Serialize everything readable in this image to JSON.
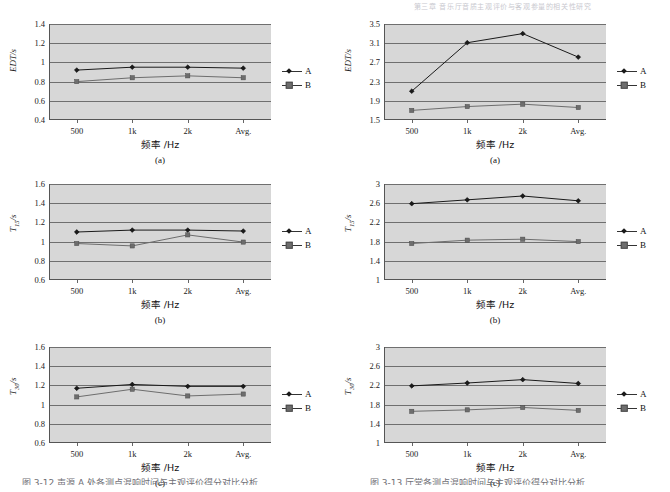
{
  "header": {
    "text": "第三章 音乐厅音质主观评价与客观参量的相关性研究"
  },
  "legend": {
    "series_a": "A",
    "series_b": "B"
  },
  "axis": {
    "x_title": "频率 /Hz",
    "x_categories": [
      "500",
      "1k",
      "2k",
      "Avg."
    ]
  },
  "captions": {
    "a": "(a)",
    "b": "(b)",
    "c": "(c)"
  },
  "bottom_captions": {
    "left": "图 3-12  声源 A 处各测点混响时间与主观评价得分对比分析",
    "right": "图 3-13  厅堂各测点混响时间与主观评价得分对比分析"
  },
  "chart_data": [
    {
      "id": "left-a",
      "type": "line",
      "title": "",
      "ylabel": "EDT/s",
      "xlabel": "频率 /Hz",
      "categories": [
        "500",
        "1k",
        "2k",
        "Avg."
      ],
      "yticks": [
        0.4,
        0.6,
        0.8,
        1.0,
        1.2,
        1.4
      ],
      "yticklabels": [
        "0.4",
        "0.6",
        "0.8",
        "1",
        "1.2",
        "1.4"
      ],
      "ylim": [
        0.4,
        1.4
      ],
      "grid": true,
      "legend_position": "right",
      "series": [
        {
          "name": "A",
          "values": [
            0.92,
            0.95,
            0.95,
            0.94
          ]
        },
        {
          "name": "B",
          "values": [
            0.8,
            0.84,
            0.86,
            0.84
          ]
        }
      ],
      "caption": "(a)"
    },
    {
      "id": "right-a",
      "type": "line",
      "title": "",
      "ylabel": "EDT/s",
      "xlabel": "频率 /Hz",
      "categories": [
        "500",
        "1k",
        "2k",
        "Avg."
      ],
      "yticks": [
        1.5,
        1.9,
        2.3,
        2.7,
        3.1,
        3.5
      ],
      "yticklabels": [
        "1.5",
        "1.9",
        "2.3",
        "2.7",
        "3.1",
        "3.5"
      ],
      "ylim": [
        1.5,
        3.5
      ],
      "grid": true,
      "legend_position": "right",
      "series": [
        {
          "name": "A",
          "values": [
            2.1,
            3.11,
            3.3,
            2.81
          ]
        },
        {
          "name": "B",
          "values": [
            1.7,
            1.78,
            1.83,
            1.76
          ]
        }
      ],
      "caption": "(a)"
    },
    {
      "id": "left-b",
      "type": "line",
      "title": "",
      "ylabel": "T15/s",
      "xlabel": "频率 /Hz",
      "categories": [
        "500",
        "1k",
        "2k",
        "Avg."
      ],
      "yticks": [
        0.6,
        0.8,
        1.0,
        1.2,
        1.4,
        1.6
      ],
      "yticklabels": [
        "0.6",
        "0.8",
        "1",
        "1.2",
        "1.4",
        "1.6"
      ],
      "ylim": [
        0.6,
        1.6
      ],
      "grid": true,
      "legend_position": "right",
      "series": [
        {
          "name": "A",
          "values": [
            1.1,
            1.12,
            1.12,
            1.11
          ]
        },
        {
          "name": "B",
          "values": [
            0.98,
            0.955,
            1.07,
            0.995
          ]
        }
      ],
      "caption": "(b)"
    },
    {
      "id": "right-b",
      "type": "line",
      "title": "",
      "ylabel": "T15/s",
      "xlabel": "频率 /Hz",
      "categories": [
        "500",
        "1k",
        "2k",
        "Avg."
      ],
      "yticks": [
        1.0,
        1.4,
        1.8,
        2.2,
        2.6,
        3.0
      ],
      "yticklabels": [
        "1",
        "1.4",
        "1.8",
        "2.2",
        "2.6",
        "3"
      ],
      "ylim": [
        1.0,
        3.0
      ],
      "grid": true,
      "legend_position": "right",
      "series": [
        {
          "name": "A",
          "values": [
            2.59,
            2.67,
            2.75,
            2.65
          ]
        },
        {
          "name": "B",
          "values": [
            1.76,
            1.83,
            1.85,
            1.8
          ]
        }
      ],
      "caption": "(b)"
    },
    {
      "id": "left-c",
      "type": "line",
      "title": "",
      "ylabel": "T30/s",
      "xlabel": "频率 /Hz",
      "categories": [
        "500",
        "1k",
        "2k",
        "Avg."
      ],
      "yticks": [
        0.6,
        0.8,
        1.0,
        1.2,
        1.4,
        1.6
      ],
      "yticklabels": [
        "0.6",
        "0.8",
        "1",
        "1.2",
        "1.4",
        "1.6"
      ],
      "ylim": [
        0.6,
        1.6
      ],
      "grid": true,
      "legend_position": "right",
      "series": [
        {
          "name": "A",
          "values": [
            1.17,
            1.21,
            1.19,
            1.19
          ]
        },
        {
          "name": "B",
          "values": [
            1.08,
            1.16,
            1.09,
            1.11
          ]
        }
      ],
      "caption": "(c)"
    },
    {
      "id": "right-c",
      "type": "line",
      "title": "",
      "ylabel": "T30/s",
      "xlabel": "频率 /Hz",
      "categories": [
        "500",
        "1k",
        "2k",
        "Avg."
      ],
      "yticks": [
        1.0,
        1.4,
        1.8,
        2.2,
        2.6,
        3.0
      ],
      "yticklabels": [
        "1",
        "1.4",
        "1.8",
        "2.2",
        "2.6",
        "3"
      ],
      "ylim": [
        1.0,
        3.0
      ],
      "grid": true,
      "legend_position": "right",
      "series": [
        {
          "name": "A",
          "values": [
            2.19,
            2.25,
            2.32,
            2.24
          ]
        },
        {
          "name": "B",
          "values": [
            1.66,
            1.69,
            1.74,
            1.68
          ]
        }
      ],
      "caption": "(c)"
    }
  ]
}
